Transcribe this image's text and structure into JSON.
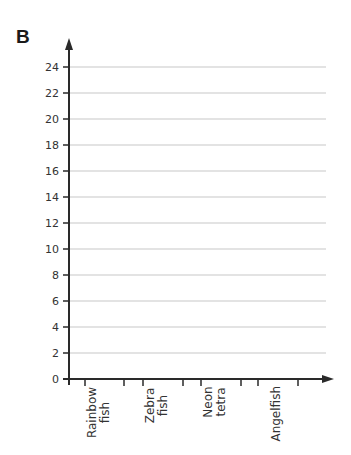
{
  "panel_label": "B",
  "chart_data": {
    "type": "bar",
    "title": "",
    "xlabel": "",
    "ylabel": "",
    "categories": [
      {
        "line1": "Rainbow",
        "line2": "fish"
      },
      {
        "line1": "Zebra",
        "line2": "fish"
      },
      {
        "line1": "Neon",
        "line2": "tetra"
      },
      {
        "line1": "Angelfish",
        "line2": ""
      }
    ],
    "category_names": [
      "Rainbow fish",
      "Zebra fish",
      "Neon tetra",
      "Angelfish"
    ],
    "values": [
      null,
      null,
      null,
      null
    ],
    "yticks": [
      0,
      2,
      4,
      6,
      8,
      10,
      12,
      14,
      16,
      18,
      20,
      22,
      24
    ],
    "ylim": [
      0,
      24
    ],
    "grid": true,
    "legend": "none",
    "note": "Blank bar chart template with no bars drawn"
  }
}
